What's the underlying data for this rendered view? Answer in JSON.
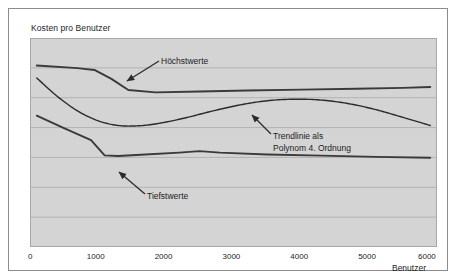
{
  "chart": {
    "title": "Kosten pro Benutzer",
    "xaxis_label": "Benutzer"
  },
  "annotations": {
    "max_label": "Höchstwerte",
    "min_label": "Tiefstwerte",
    "trend_label_line1": "Trendlinie als",
    "trend_label_line2": "Polynom 4. Ordnung"
  },
  "colors": {
    "plot_background": "#d4d4d4",
    "gridline": "#b3b3b3",
    "series_line": "#3a3a3a",
    "trend_line": "#2b2b2b",
    "frame_border": "#8d8d8d",
    "text": "#1c1c1c"
  },
  "chart_data": {
    "type": "line",
    "title": "Kosten pro Benutzer",
    "xlabel": "Benutzer",
    "ylabel": "",
    "xlim": [
      0,
      6000
    ],
    "ylim": [
      0,
      7
    ],
    "xticks": [
      0,
      1000,
      2000,
      3000,
      4000,
      5000,
      6000
    ],
    "xticklabels": [
      "0",
      "1000",
      "2000",
      "3000",
      "4000",
      "5000",
      "6000"
    ],
    "yticks": [
      1,
      2,
      3,
      4,
      5,
      6
    ],
    "yticklabels": [
      "",
      "",
      "",
      "",
      "",
      ""
    ],
    "grid": "horizontal",
    "legend": "none",
    "annotations": [
      {
        "text": "Höchstwerte",
        "points_to_series": "Höchstwerte",
        "x": 1450,
        "y": 5.25
      },
      {
        "text": "Tiefstwerte",
        "points_to_series": "Tiefstwerte",
        "x": 1180,
        "y": 2.65
      },
      {
        "text": "Trendlinie als Polynom 4. Ordnung",
        "points_to_series": "Trendlinie als Polynom 4. Ordnung",
        "x": 3100,
        "y": 4.35
      }
    ],
    "series": [
      {
        "name": "Höchstwerte",
        "x": [
          100,
          700,
          950,
          1200,
          1450,
          1850,
          2500,
          3200,
          4000,
          4800,
          5500,
          5900
        ],
        "y": [
          6.08,
          5.99,
          5.93,
          5.63,
          5.26,
          5.18,
          5.21,
          5.24,
          5.27,
          5.3,
          5.33,
          5.36
        ]
      },
      {
        "name": "Trendlinie als Polynom 4. Ordnung",
        "x": [
          100,
          400,
          700,
          1000,
          1300,
          1600,
          1900,
          2300,
          2700,
          3100,
          3500,
          3900,
          4300,
          4700,
          5100,
          5500,
          5900
        ],
        "y": [
          5.66,
          5.05,
          4.56,
          4.23,
          4.07,
          4.06,
          4.14,
          4.33,
          4.56,
          4.76,
          4.9,
          4.95,
          4.92,
          4.8,
          4.6,
          4.34,
          4.07
        ]
      },
      {
        "name": "Tiefstwerte",
        "x": [
          100,
          500,
          900,
          1100,
          1300,
          1700,
          2200,
          2500,
          2800,
          3500,
          4300,
          5100,
          5900
        ],
        "y": [
          4.4,
          3.98,
          3.58,
          3.07,
          3.05,
          3.1,
          3.16,
          3.21,
          3.16,
          3.1,
          3.06,
          3.02,
          2.99
        ]
      }
    ]
  }
}
